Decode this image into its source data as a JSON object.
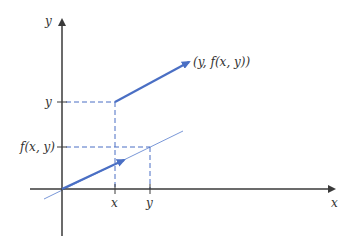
{
  "diagram": {
    "title": "",
    "colors": {
      "axis": "#3a3a3a",
      "vector": "#4a6fc4",
      "thin_line": "#7a98d8",
      "dashed": "#4a6fc4",
      "text": "#333333"
    },
    "axes": {
      "x_label": "x",
      "y_label": "y"
    },
    "ticks": {
      "x_axis": [
        {
          "label": "x"
        },
        {
          "label": "y"
        }
      ],
      "y_axis": [
        {
          "label": "y"
        },
        {
          "label": "f(x, y)"
        }
      ]
    },
    "vectors": {
      "upper_label": "(y, f(x, y))"
    }
  }
}
